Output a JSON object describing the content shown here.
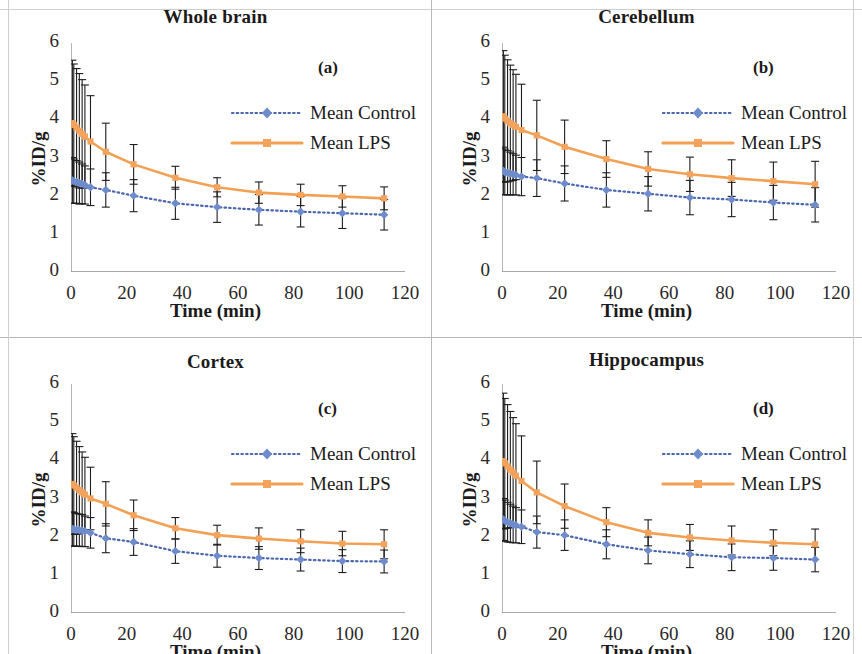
{
  "figure": {
    "axis": {
      "x_title": "Time (min)",
      "y_title": "%ID/g",
      "x_ticks": [
        "0",
        "20",
        "40",
        "60",
        "80",
        "100",
        "120"
      ],
      "y_ticks": [
        "6",
        "5",
        "4",
        "3",
        "2",
        "1",
        "0"
      ],
      "xlim": [
        0,
        120
      ],
      "ylim": [
        0,
        6
      ]
    },
    "legend": {
      "control_label": "Mean Control",
      "lps_label": "Mean LPS"
    },
    "colors": {
      "control": "#6E8BCB",
      "control_line": "#4A66B0",
      "lps": "#F4A35C",
      "lps_line": "#F2A054",
      "error_bar": "#1d1d1d",
      "axis": "#8d8d8d",
      "text": "#1c1a1a"
    },
    "panel_letters": [
      "(a)",
      "(b)",
      "(c)",
      "(d)"
    ]
  },
  "chart_data": [
    {
      "type": "line",
      "title": "Whole brain",
      "panel": "(a)",
      "xlabel": "Time (min)",
      "ylabel": "%ID/g",
      "xlim": [
        0,
        120
      ],
      "ylim": [
        0,
        6
      ],
      "grid": false,
      "legend_position": "upper-right",
      "x": [
        0.5,
        1,
        2,
        3,
        4,
        5,
        7,
        12.5,
        22.5,
        37.5,
        52.5,
        67.5,
        82.5,
        97.5,
        112.5
      ],
      "series": [
        {
          "name": "Mean Control",
          "values": [
            2.4,
            2.38,
            2.36,
            2.33,
            2.31,
            2.28,
            2.22,
            2.15,
            2.0,
            1.8,
            1.7,
            1.63,
            1.58,
            1.54,
            1.5
          ],
          "error": [
            0.6,
            0.58,
            0.56,
            0.55,
            0.52,
            0.5,
            0.48,
            0.45,
            0.42,
            0.42,
            0.4,
            0.4,
            0.4,
            0.4,
            0.4
          ]
        },
        {
          "name": "Mean LPS",
          "values": [
            3.9,
            3.85,
            3.78,
            3.7,
            3.62,
            3.55,
            3.42,
            3.15,
            2.82,
            2.47,
            2.22,
            2.08,
            2.02,
            1.98,
            1.93
          ],
          "error": [
            1.65,
            1.6,
            1.55,
            1.5,
            1.42,
            1.35,
            1.2,
            0.75,
            0.52,
            0.3,
            0.25,
            0.28,
            0.28,
            0.28,
            0.3
          ]
        }
      ]
    },
    {
      "type": "line",
      "title": "Cerebellum",
      "panel": "(b)",
      "xlabel": "Time (min)",
      "ylabel": "%ID/g",
      "xlim": [
        0,
        120
      ],
      "ylim": [
        0,
        6
      ],
      "grid": false,
      "legend_position": "upper-right",
      "x": [
        0.5,
        1,
        2,
        3,
        4,
        5,
        7,
        12.5,
        22.5,
        37.5,
        52.5,
        67.5,
        82.5,
        97.5,
        112.5
      ],
      "series": [
        {
          "name": "Mean Control",
          "values": [
            2.65,
            2.62,
            2.6,
            2.58,
            2.56,
            2.54,
            2.5,
            2.46,
            2.32,
            2.15,
            2.05,
            1.95,
            1.9,
            1.82,
            1.76
          ],
          "error": [
            0.62,
            0.6,
            0.58,
            0.56,
            0.54,
            0.52,
            0.5,
            0.48,
            0.46,
            0.45,
            0.45,
            0.45,
            0.45,
            0.45,
            0.45
          ]
        },
        {
          "name": "Mean LPS",
          "values": [
            4.08,
            4.02,
            3.96,
            3.9,
            3.85,
            3.8,
            3.72,
            3.58,
            3.28,
            2.96,
            2.7,
            2.56,
            2.46,
            2.38,
            2.3
          ],
          "error": [
            1.72,
            1.66,
            1.6,
            1.52,
            1.45,
            1.38,
            1.2,
            0.92,
            0.7,
            0.48,
            0.45,
            0.45,
            0.48,
            0.5,
            0.6
          ]
        }
      ]
    },
    {
      "type": "line",
      "title": "Cortex",
      "panel": "(c)",
      "xlabel": "Time (min)",
      "ylabel": "%ID/g",
      "xlim": [
        0,
        120
      ],
      "ylim": [
        0,
        6
      ],
      "grid": false,
      "legend_position": "upper-right",
      "x": [
        0.5,
        1,
        2,
        3,
        4,
        5,
        7,
        12.5,
        22.5,
        37.5,
        52.5,
        67.5,
        82.5,
        97.5,
        112.5
      ],
      "series": [
        {
          "name": "Mean Control",
          "values": [
            2.2,
            2.19,
            2.18,
            2.17,
            2.16,
            2.14,
            2.1,
            1.96,
            1.86,
            1.62,
            1.5,
            1.44,
            1.4,
            1.36,
            1.35
          ],
          "error": [
            0.45,
            0.44,
            0.43,
            0.42,
            0.42,
            0.4,
            0.4,
            0.38,
            0.35,
            0.32,
            0.3,
            0.3,
            0.3,
            0.3,
            0.3
          ]
        },
        {
          "name": "Mean LPS",
          "values": [
            3.38,
            3.34,
            3.28,
            3.22,
            3.16,
            3.1,
            3.0,
            2.86,
            2.56,
            2.22,
            2.04,
            1.95,
            1.88,
            1.82,
            1.8
          ],
          "error": [
            1.32,
            1.28,
            1.22,
            1.14,
            1.06,
            0.98,
            0.82,
            0.58,
            0.4,
            0.28,
            0.26,
            0.28,
            0.3,
            0.32,
            0.38
          ]
        }
      ]
    },
    {
      "type": "line",
      "title": "Hippocampus",
      "panel": "(d)",
      "xlabel": "Time (min)",
      "ylabel": "%ID/g",
      "xlim": [
        0,
        120
      ],
      "ylim": [
        0,
        6
      ],
      "grid": false,
      "legend_position": "upper-right",
      "x": [
        0.5,
        1,
        2,
        3,
        4,
        5,
        7,
        12.5,
        22.5,
        37.5,
        52.5,
        67.5,
        82.5,
        97.5,
        112.5
      ],
      "series": [
        {
          "name": "Mean Control",
          "values": [
            2.45,
            2.42,
            2.38,
            2.35,
            2.32,
            2.3,
            2.26,
            2.12,
            2.04,
            1.8,
            1.64,
            1.54,
            1.46,
            1.44,
            1.4
          ],
          "error": [
            0.55,
            0.54,
            0.52,
            0.5,
            0.48,
            0.46,
            0.44,
            0.42,
            0.4,
            0.38,
            0.35,
            0.35,
            0.35,
            0.32,
            0.32
          ]
        },
        {
          "name": "Mean LPS",
          "values": [
            3.98,
            3.92,
            3.84,
            3.76,
            3.68,
            3.6,
            3.46,
            3.16,
            2.8,
            2.38,
            2.1,
            1.98,
            1.9,
            1.84,
            1.8
          ],
          "error": [
            1.78,
            1.7,
            1.62,
            1.52,
            1.44,
            1.36,
            1.18,
            0.82,
            0.58,
            0.38,
            0.34,
            0.34,
            0.38,
            0.34,
            0.4
          ]
        }
      ]
    }
  ]
}
